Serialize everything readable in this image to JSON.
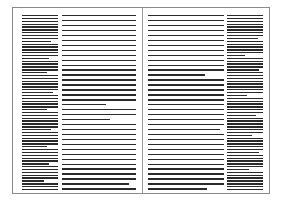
{
  "document": {
    "type": "two-page spread layout thumbnail",
    "colors": {
      "border": "#8a8a8a",
      "fold": "#9a9a9a",
      "text_line": "#2a2a2a",
      "background": "#ffffff"
    },
    "columns": [
      {
        "id": "left-margin-column",
        "x": 9,
        "width": 36,
        "line_count": 62,
        "line_pitch": 2.85,
        "short_lines": [
          [
            9,
            0.8
          ],
          [
            15,
            0.75
          ],
          [
            20,
            0.7
          ],
          [
            27,
            0.85
          ],
          [
            33,
            0.7
          ],
          [
            40,
            0.8
          ],
          [
            46,
            0.7
          ],
          [
            52,
            0.75
          ],
          [
            58,
            0.6
          ]
        ]
      },
      {
        "id": "left-main-column",
        "x": 49,
        "width": 74,
        "line_count": 36,
        "line_pitch": 4.95,
        "short_lines": [
          [
            18,
            0.6
          ],
          [
            21,
            0.65
          ],
          [
            34,
            0.9
          ]
        ]
      },
      {
        "id": "right-main-column",
        "x": 135,
        "width": 76,
        "line_count": 36,
        "line_pitch": 4.95,
        "short_lines": [
          [
            12,
            0.75
          ],
          [
            23,
            0.95
          ],
          [
            35,
            0.78
          ]
        ]
      },
      {
        "id": "right-margin-column",
        "x": 214,
        "width": 36,
        "line_count": 62,
        "line_pitch": 2.85,
        "short_lines": [
          [
            8,
            0.85
          ],
          [
            14,
            0.5
          ],
          [
            19,
            0.9
          ],
          [
            28,
            0.55
          ],
          [
            35,
            0.8
          ],
          [
            42,
            0.7
          ],
          [
            48,
            0.9
          ],
          [
            54,
            0.6
          ]
        ]
      }
    ]
  }
}
